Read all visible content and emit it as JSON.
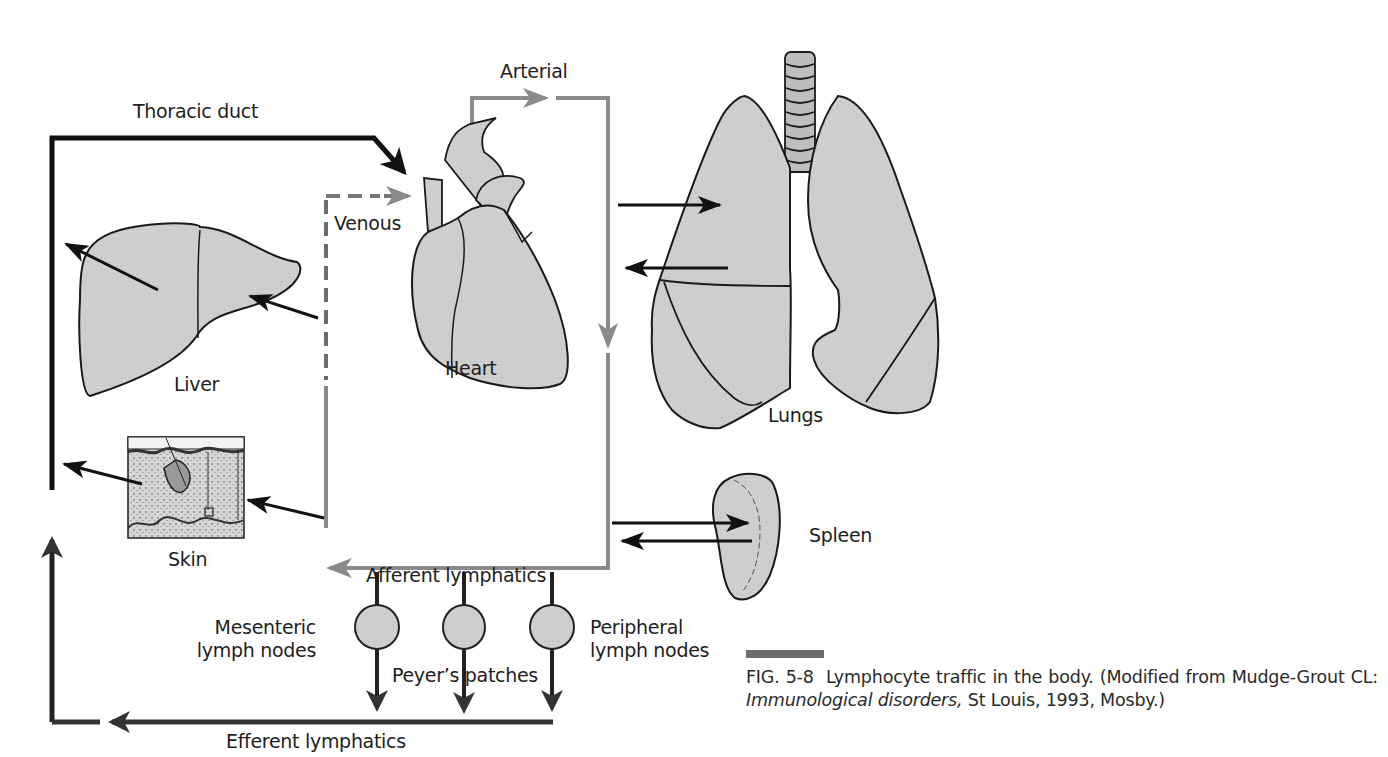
{
  "figure": {
    "labels": {
      "thoracic_duct": "Thoracic duct",
      "arterial": "Arterial",
      "venous": "Venous",
      "liver": "Liver",
      "heart": "Heart",
      "lungs": "Lungs",
      "skin": "Skin",
      "spleen": "Spleen",
      "afferent_lymphatics": "Afferent lymphatics",
      "mesenteric_line1": "Mesenteric",
      "mesenteric_line2": "lymph nodes",
      "peyers_patches": "Peyer’s patches",
      "peripheral_line1": "Peripheral",
      "peripheral_line2": "lymph nodes",
      "efferent_lymphatics": "Efferent lymphatics"
    },
    "caption": {
      "fig_number": "FIG. 5-8",
      "text_before": "Lymphocyte traffic in the body. (Modified from Mudge-Grout CL: ",
      "italic_title": "Immunological disorders,",
      "text_after": " St Louis, 1993, Mosby.)"
    },
    "colors": {
      "lymph_line": "#111111",
      "blood_line": "#8a8a8a",
      "organ_fill": "#cfcfcf",
      "organ_stroke": "#1a1a1a",
      "caption_bar": "#6b6b6b"
    }
  }
}
